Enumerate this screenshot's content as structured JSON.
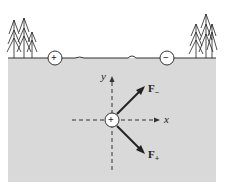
{
  "diagram": {
    "surface_charges": [
      {
        "sign": "+",
        "label": "+"
      },
      {
        "sign": "-",
        "label": "−"
      }
    ],
    "test_charge": {
      "label": "+"
    },
    "axes": {
      "x_label": "x",
      "y_label": "y"
    },
    "forces": [
      {
        "name": "F",
        "subscript": "−",
        "direction": "up-right"
      },
      {
        "name": "F",
        "subscript": "+",
        "direction": "down-right"
      }
    ],
    "colors": {
      "ground": "#d9d9d9",
      "line": "#222222",
      "background": "#ffffff"
    }
  }
}
